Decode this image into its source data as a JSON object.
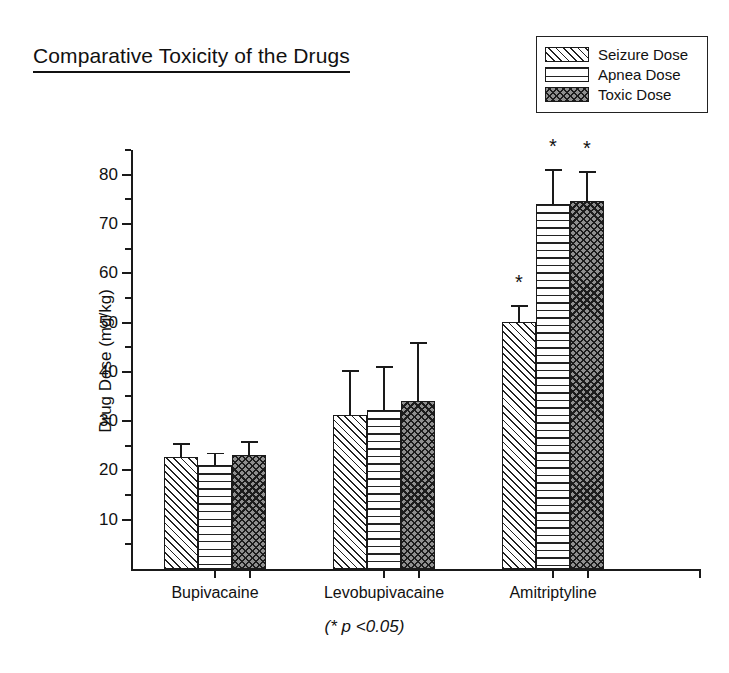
{
  "chart_data": {
    "type": "bar",
    "title": "Comparative Toxicity of the Drugs",
    "xlabel": "",
    "ylabel": "Drug Dose (mg/kg)",
    "ylim": [
      0,
      85
    ],
    "y_major_ticks": [
      10,
      20,
      30,
      40,
      50,
      60,
      70,
      80
    ],
    "y_minor_ticks": [
      5,
      15,
      25,
      35,
      45,
      55,
      65,
      75,
      85
    ],
    "grid": false,
    "legend_position": "top-right",
    "categories": [
      "Bupivacaine",
      "Levobupivacaine",
      "Amitriptyline"
    ],
    "series": [
      {
        "name": "Seizure Dose",
        "pattern": "diagonal-hatch",
        "values": [
          22.7,
          31.3,
          50.1
        ],
        "errors": [
          2.9,
          9.0,
          3.4
        ],
        "significance": [
          "",
          "",
          "*"
        ]
      },
      {
        "name": "Apnea Dose",
        "pattern": "horizontal-lines",
        "values": [
          21.0,
          32.2,
          74.0
        ],
        "errors": [
          2.6,
          9.0,
          7.2
        ],
        "significance": [
          "",
          "",
          "*"
        ]
      },
      {
        "name": "Toxic Dose",
        "pattern": "cross-hatch",
        "values": [
          23.1,
          34.0,
          74.7
        ],
        "errors": [
          2.9,
          12.0,
          6.1
        ],
        "significance": [
          "",
          "",
          "*"
        ]
      }
    ],
    "annotations": [
      "(* p <0.05)"
    ]
  },
  "legend": {
    "items": [
      {
        "label": "Seizure Dose"
      },
      {
        "label": "Apnea Dose"
      },
      {
        "label": "Toxic Dose"
      }
    ]
  },
  "axes": {
    "y_label": "Drug Dose (mg/kg)",
    "y_ticks": [
      "80",
      "70",
      "60",
      "50",
      "40",
      "30",
      "20",
      "10"
    ],
    "x_ticks": [
      "Bupivacaine",
      "Levobupivacaine",
      "Amitriptyline"
    ]
  },
  "footnote": "(* p <0.05)",
  "colors": {
    "ink": "#1a1a1a",
    "background": "#ffffff",
    "toxic_fill": "#8f8f8f"
  }
}
